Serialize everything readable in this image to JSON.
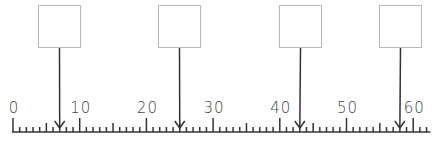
{
  "number_line": {
    "start": 0,
    "end": 62,
    "major_step": 10,
    "minor_step": 1,
    "mid_step": 5,
    "labels": [
      "0",
      "10",
      "20",
      "30",
      "40",
      "50",
      "60"
    ],
    "origin_x": 13,
    "px_per_unit": 6.67
  },
  "boxes": [
    {
      "value": "",
      "points_to": 7
    },
    {
      "value": "",
      "points_to": 25
    },
    {
      "value": "",
      "points_to": 43
    },
    {
      "value": "",
      "points_to": 58
    }
  ]
}
